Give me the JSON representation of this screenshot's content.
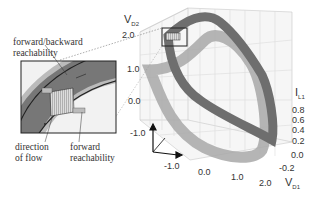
{
  "figure": {
    "annotations": {
      "fb_reach_line1": "forward/backward",
      "fb_reach_line2": "reachability",
      "direction_line1": "direction",
      "direction_line2": "of flow",
      "fwd_reach_line1": "forward",
      "fwd_reach_line2": "reachability"
    },
    "axes": {
      "z_axis": {
        "name": "V",
        "sub": "D2",
        "ticks": [
          "2.0",
          "1.0",
          "0.0",
          "-1.0"
        ]
      },
      "y_axis": {
        "name": "I",
        "sub": "L1",
        "ticks": [
          "0.8",
          "0.6",
          "0.4",
          "0.2",
          "0.0",
          "-0.2"
        ]
      },
      "x_axis": {
        "name": "V",
        "sub": "D1",
        "ticks": [
          "-1.0",
          "0.0",
          "1.0",
          "2.0"
        ]
      }
    },
    "colors": {
      "band_dark": "#6e6e6e",
      "band_light": "#a8a8a8",
      "grid": "#c8c8c8",
      "text": "#333333"
    }
  }
}
